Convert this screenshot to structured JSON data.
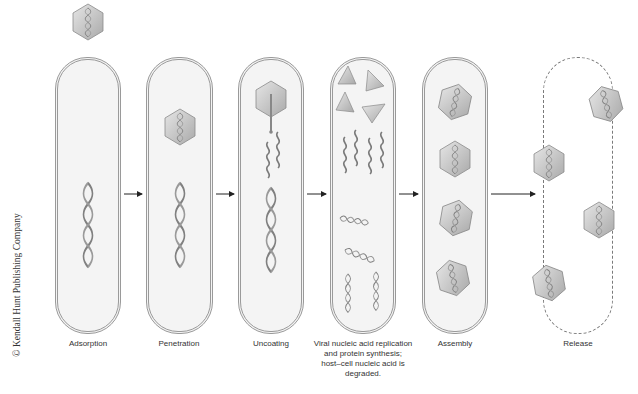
{
  "diagram": {
    "credit": "© Kendall Hunt Publishing Company",
    "stages": [
      {
        "id": "adsorption",
        "label": "Adsorption"
      },
      {
        "id": "penetration",
        "label": "Penetration"
      },
      {
        "id": "uncoating",
        "label": "Uncoating"
      },
      {
        "id": "replication",
        "label_lines": [
          "Viral nucleic acid replication",
          "and protein synthesis;",
          "host–cell nucleic acid is",
          "degraded."
        ]
      },
      {
        "id": "assembly",
        "label": "Assembly"
      },
      {
        "id": "release",
        "label": "Release"
      }
    ],
    "colors": {
      "cell_fill": "#f4f4f4",
      "cell_border": "#9a9a9a",
      "capsid_fill": "#c8c8c8",
      "capsid_stroke": "#8a8a8a",
      "dna": "#7a7a7a",
      "arrow": "#222222",
      "text": "#333333"
    }
  }
}
